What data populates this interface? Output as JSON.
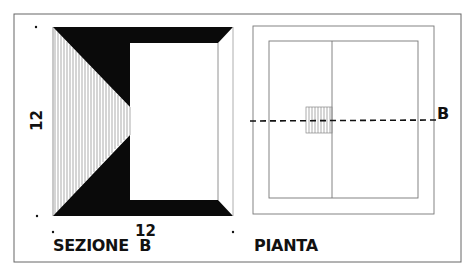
{
  "section": {
    "title": "SEZIONE  B",
    "dimension_horizontal": "12",
    "dimension_vertical": "12"
  },
  "plan": {
    "title": "PIANTA",
    "section_marker": "B"
  },
  "colors": {
    "ink": "#0a0a0a",
    "line": "#777777",
    "frame": "#666666",
    "background": "#ffffff"
  }
}
